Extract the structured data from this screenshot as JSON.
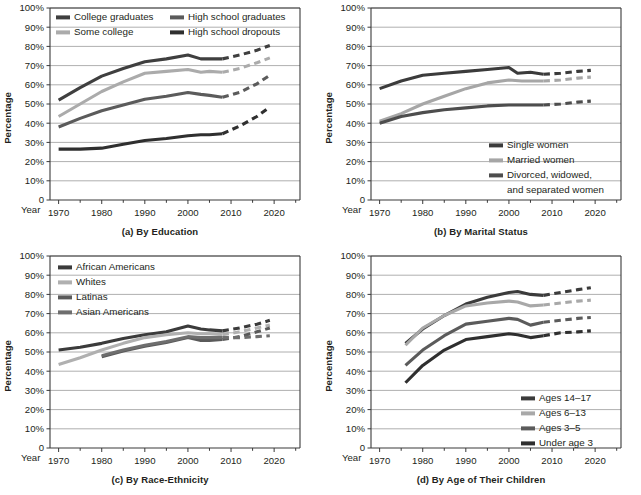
{
  "figure": {
    "title": "",
    "axis_label_y": "Percentage",
    "year_label": "Year",
    "y_ticks": [
      "0",
      "10%",
      "20%",
      "30%",
      "40%",
      "50%",
      "60%",
      "70%",
      "80%",
      "90%",
      "100%"
    ],
    "x_ticks": [
      "1970",
      "1980",
      "1990",
      "2000",
      "2010",
      "2020"
    ]
  },
  "colors": {
    "dark": "#3b3b3b",
    "mid_dark": "#565656",
    "mid": "#6e6e6e",
    "light": "#a6a6a6",
    "lighter": "#b9b9b9",
    "grid": "#9b9b9b",
    "axis": "#3a3a3a",
    "text": "#231f20",
    "background": "#ffffff"
  },
  "chart_data": [
    {
      "id": "a",
      "type": "line",
      "title": "(a) By Education",
      "xlabel": "Year",
      "ylabel": "Percentage",
      "xlim": [
        1968,
        2026
      ],
      "ylim": [
        0,
        100
      ],
      "grid": true,
      "legend_position": "top-inside",
      "x_ticks": [
        1970,
        1980,
        1990,
        2000,
        2010,
        2020
      ],
      "y_ticks": [
        0,
        10,
        20,
        30,
        40,
        50,
        60,
        70,
        80,
        90,
        100
      ],
      "series": [
        {
          "name": "College graduates",
          "color": "#3f3f3f",
          "solid": {
            "x": [
              1970,
              1975,
              1980,
              1985,
              1990,
              1995,
              2000,
              2003,
              2005,
              2008
            ],
            "y": [
              52,
              58.5,
              64.5,
              68.5,
              72,
              73.5,
              75.5,
              73.5,
              73.5,
              73.5
            ]
          },
          "projected": {
            "x": [
              2008,
              2012,
              2016,
              2019
            ],
            "y": [
              73.5,
              75.5,
              78,
              80.5
            ]
          }
        },
        {
          "name": "Some college",
          "color": "#ababab",
          "solid": {
            "x": [
              1970,
              1975,
              1980,
              1985,
              1990,
              1995,
              2000,
              2003,
              2005,
              2008
            ],
            "y": [
              43.5,
              50,
              56.5,
              61.5,
              66,
              67,
              68,
              66.5,
              67,
              66.5
            ]
          },
          "projected": {
            "x": [
              2008,
              2012,
              2016,
              2019
            ],
            "y": [
              66.5,
              68.5,
              71.5,
              74
            ]
          }
        },
        {
          "name": "High school graduates",
          "color": "#5b5b5b",
          "solid": {
            "x": [
              1970,
              1975,
              1980,
              1985,
              1990,
              1995,
              2000,
              2003,
              2005,
              2008
            ],
            "y": [
              38,
              42.5,
              46.5,
              49.5,
              52.5,
              54,
              56,
              55,
              54.5,
              53.5
            ]
          },
          "projected": {
            "x": [
              2008,
              2012,
              2016,
              2019
            ],
            "y": [
              53.5,
              56,
              60.5,
              65
            ]
          }
        },
        {
          "name": "High school dropouts",
          "color": "#2f2f2f",
          "solid": {
            "x": [
              1970,
              1975,
              1980,
              1985,
              1990,
              1995,
              2000,
              2003,
              2005,
              2008
            ],
            "y": [
              26.5,
              26.5,
              27,
              29,
              31,
              32,
              33.5,
              34,
              34,
              34.5
            ]
          },
          "projected": {
            "x": [
              2008,
              2012,
              2016,
              2019
            ],
            "y": [
              34.5,
              38.5,
              43.5,
              48.5
            ]
          }
        }
      ]
    },
    {
      "id": "b",
      "type": "line",
      "title": "(b) By Marital Status",
      "xlabel": "Year",
      "ylabel": "Percentage",
      "xlim": [
        1968,
        2026
      ],
      "ylim": [
        0,
        100
      ],
      "grid": true,
      "legend_position": "bottom-right-inside",
      "x_ticks": [
        1970,
        1980,
        1990,
        2000,
        2010,
        2020
      ],
      "y_ticks": [
        0,
        10,
        20,
        30,
        40,
        50,
        60,
        70,
        80,
        90,
        100
      ],
      "series": [
        {
          "name": "Single women",
          "color": "#3b3b3b",
          "solid": {
            "x": [
              1970,
              1975,
              1980,
              1985,
              1990,
              1995,
              2000,
              2002,
              2005,
              2008
            ],
            "y": [
              58,
              62,
              65,
              66,
              67,
              68,
              69,
              66,
              66.5,
              65.5
            ]
          },
          "projected": {
            "x": [
              2008,
              2012,
              2016,
              2019
            ],
            "y": [
              65.5,
              66,
              67,
              67.5
            ]
          }
        },
        {
          "name": "Married women",
          "color": "#a6a6a6",
          "solid": {
            "x": [
              1970,
              1975,
              1980,
              1985,
              1990,
              1995,
              2000,
              2003,
              2005,
              2008
            ],
            "y": [
              41,
              45,
              50,
              54,
              58,
              61,
              62.5,
              62,
              62,
              62
            ]
          },
          "projected": {
            "x": [
              2008,
              2012,
              2016,
              2019
            ],
            "y": [
              62,
              62.5,
              63.5,
              64
            ]
          }
        },
        {
          "name": "Divorced, widowed, and separated women",
          "color": "#4d4d4d",
          "solid": {
            "x": [
              1970,
              1975,
              1980,
              1985,
              1990,
              1995,
              2000,
              2003,
              2005,
              2008
            ],
            "y": [
              40,
              43.5,
              45.5,
              47,
              48,
              49,
              49.5,
              49.5,
              49.5,
              49.5
            ]
          },
          "projected": {
            "x": [
              2008,
              2012,
              2016,
              2019
            ],
            "y": [
              49.5,
              50,
              51,
              51.5
            ]
          }
        }
      ]
    },
    {
      "id": "c",
      "type": "line",
      "title": "(c) By Race-Ethnicity",
      "xlabel": "Year",
      "ylabel": "Percentage",
      "xlim": [
        1968,
        2026
      ],
      "ylim": [
        0,
        100
      ],
      "grid": true,
      "legend_position": "top-left-inside",
      "x_ticks": [
        1970,
        1980,
        1990,
        2000,
        2010,
        2020
      ],
      "y_ticks": [
        0,
        10,
        20,
        30,
        40,
        50,
        60,
        70,
        80,
        90,
        100
      ],
      "series": [
        {
          "name": "African Americans",
          "color": "#3b3b3b",
          "solid": {
            "x": [
              1970,
              1975,
              1980,
              1985,
              1990,
              1995,
              2000,
              2003,
              2005,
              2008
            ],
            "y": [
              51,
              52.5,
              54.5,
              57,
              59,
              60.5,
              63.5,
              62,
              61.5,
              61
            ]
          },
          "projected": {
            "x": [
              2008,
              2012,
              2016,
              2019
            ],
            "y": [
              61,
              62.5,
              64.5,
              66.5
            ]
          }
        },
        {
          "name": "Whites",
          "color": "#b0b0b0",
          "solid": {
            "x": [
              1970,
              1975,
              1980,
              1985,
              1990,
              1995,
              2000,
              2003,
              2005,
              2008
            ],
            "y": [
              43.5,
              47,
              51,
              54.5,
              57.5,
              59,
              60,
              59.5,
              59.5,
              59
            ]
          },
          "projected": {
            "x": [
              2008,
              2012,
              2016,
              2019
            ],
            "y": [
              59,
              60.5,
              62.5,
              64
            ]
          }
        },
        {
          "name": "Latinas",
          "color": "#5a5a5a",
          "solid": {
            "x": [
              1980,
              1985,
              1990,
              1995,
              2000,
              2003,
              2005,
              2008
            ],
            "y": [
              47.5,
              50.5,
              53,
              55,
              57.5,
              56,
              56,
              56.5
            ]
          },
          "projected": {
            "x": [
              2008,
              2012,
              2016,
              2019
            ],
            "y": [
              56.5,
              58,
              60.5,
              62.5
            ]
          }
        },
        {
          "name": "Asian Americans",
          "color": "#6e6e6e",
          "solid": {
            "x": [
              1980,
              1985,
              1990,
              1995,
              2000,
              2003,
              2005,
              2008
            ],
            "y": [
              48,
              51,
              53.5,
              55.5,
              58,
              57.5,
              57.5,
              57.5
            ]
          },
          "projected": {
            "x": [
              2008,
              2012,
              2016,
              2019
            ],
            "y": [
              57.5,
              57.5,
              58,
              58.5
            ]
          }
        }
      ]
    },
    {
      "id": "d",
      "type": "line",
      "title": "(d) By Age of Their Children",
      "xlabel": "Year",
      "ylabel": "Percentage",
      "xlim": [
        1968,
        2026
      ],
      "ylim": [
        0,
        100
      ],
      "grid": true,
      "legend_position": "bottom-right-inside",
      "x_ticks": [
        1970,
        1980,
        1990,
        2000,
        2010,
        2020
      ],
      "y_ticks": [
        0,
        10,
        20,
        30,
        40,
        50,
        60,
        70,
        80,
        90,
        100
      ],
      "series": [
        {
          "name": "Ages 14–17",
          "color": "#3b3b3b",
          "solid": {
            "x": [
              1976,
              1980,
              1985,
              1990,
              1995,
              2000,
              2002,
              2005,
              2008
            ],
            "y": [
              54.5,
              62,
              69,
              75,
              78.5,
              81,
              81.5,
              80,
              79.5
            ]
          },
          "projected": {
            "x": [
              2008,
              2012,
              2016,
              2019
            ],
            "y": [
              79.5,
              81,
              82.5,
              83.5
            ]
          }
        },
        {
          "name": "Ages 6–13",
          "color": "#a8a8a8",
          "solid": {
            "x": [
              1976,
              1980,
              1985,
              1990,
              1995,
              2000,
              2002,
              2005,
              2008
            ],
            "y": [
              53.5,
              62.5,
              69,
              74,
              75.5,
              76.5,
              76,
              74,
              74.5
            ]
          },
          "projected": {
            "x": [
              2008,
              2012,
              2016,
              2019
            ],
            "y": [
              74.5,
              75.5,
              76.5,
              77
            ]
          }
        },
        {
          "name": "Ages 3–5",
          "color": "#5b5b5b",
          "solid": {
            "x": [
              1976,
              1980,
              1985,
              1990,
              1995,
              2000,
              2002,
              2005,
              2008
            ],
            "y": [
              43,
              51,
              58.5,
              64.5,
              66,
              67.5,
              67,
              64,
              65.5
            ]
          },
          "projected": {
            "x": [
              2008,
              2012,
              2016,
              2019
            ],
            "y": [
              65.5,
              66.5,
              67.5,
              68
            ]
          }
        },
        {
          "name": "Under age 3",
          "color": "#2f2f2f",
          "solid": {
            "x": [
              1976,
              1980,
              1985,
              1990,
              1995,
              2000,
              2002,
              2005,
              2008
            ],
            "y": [
              34,
              43,
              51,
              56.5,
              58,
              59.5,
              59,
              57.5,
              58.5
            ]
          },
          "projected": {
            "x": [
              2008,
              2012,
              2016,
              2019
            ],
            "y": [
              58.5,
              60,
              60.5,
              61
            ]
          }
        }
      ]
    }
  ],
  "legends": {
    "a": [
      {
        "label": "College graduates",
        "color": "#3f3f3f"
      },
      {
        "label": "High school graduates",
        "color": "#5b5b5b"
      },
      {
        "label": "Some college",
        "color": "#ababab"
      },
      {
        "label": "High school dropouts",
        "color": "#2f2f2f"
      }
    ],
    "b": [
      {
        "label": "Single women",
        "color": "#3b3b3b"
      },
      {
        "label": "Married women",
        "color": "#a6a6a6"
      },
      {
        "label": "Divorced, widowed,",
        "color": "#4d4d4d"
      },
      {
        "label": "and separated women",
        "color": ""
      }
    ],
    "c": [
      {
        "label": "African Americans",
        "color": "#3b3b3b"
      },
      {
        "label": "Whites",
        "color": "#b0b0b0"
      },
      {
        "label": "Latinas",
        "color": "#5a5a5a"
      },
      {
        "label": "Asian Americans",
        "color": "#6e6e6e"
      }
    ],
    "d": [
      {
        "label": "Ages 14–17",
        "color": "#3b3b3b"
      },
      {
        "label": "Ages 6–13",
        "color": "#a8a8a8"
      },
      {
        "label": "Ages 3–5",
        "color": "#5b5b5b"
      },
      {
        "label": "Under age 3",
        "color": "#2f2f2f"
      }
    ]
  }
}
